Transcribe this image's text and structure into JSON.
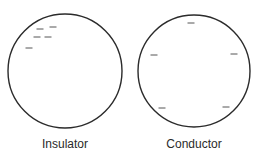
{
  "diagram": {
    "colors": {
      "outline": "#2b2b2b",
      "charge": "#555555",
      "text": "#2a2a2a"
    },
    "spheres": [
      {
        "label": "Insulator",
        "cx": 65,
        "cy": 71,
        "r": 57,
        "charges": [
          {
            "symbol": "−",
            "x": 40,
            "y": 29
          },
          {
            "symbol": "−",
            "x": 53,
            "y": 27
          },
          {
            "symbol": "−",
            "x": 37,
            "y": 37
          },
          {
            "symbol": "−",
            "x": 48,
            "y": 37
          },
          {
            "symbol": "−",
            "x": 29,
            "y": 48
          }
        ]
      },
      {
        "label": "Conductor",
        "cx": 194,
        "cy": 71,
        "r": 56,
        "charges": [
          {
            "symbol": "−",
            "x": 191,
            "y": 23
          },
          {
            "symbol": "−",
            "x": 154,
            "y": 55
          },
          {
            "symbol": "−",
            "x": 234,
            "y": 54
          },
          {
            "symbol": "−",
            "x": 162,
            "y": 108
          },
          {
            "symbol": "−",
            "x": 226,
            "y": 107
          }
        ]
      }
    ]
  }
}
